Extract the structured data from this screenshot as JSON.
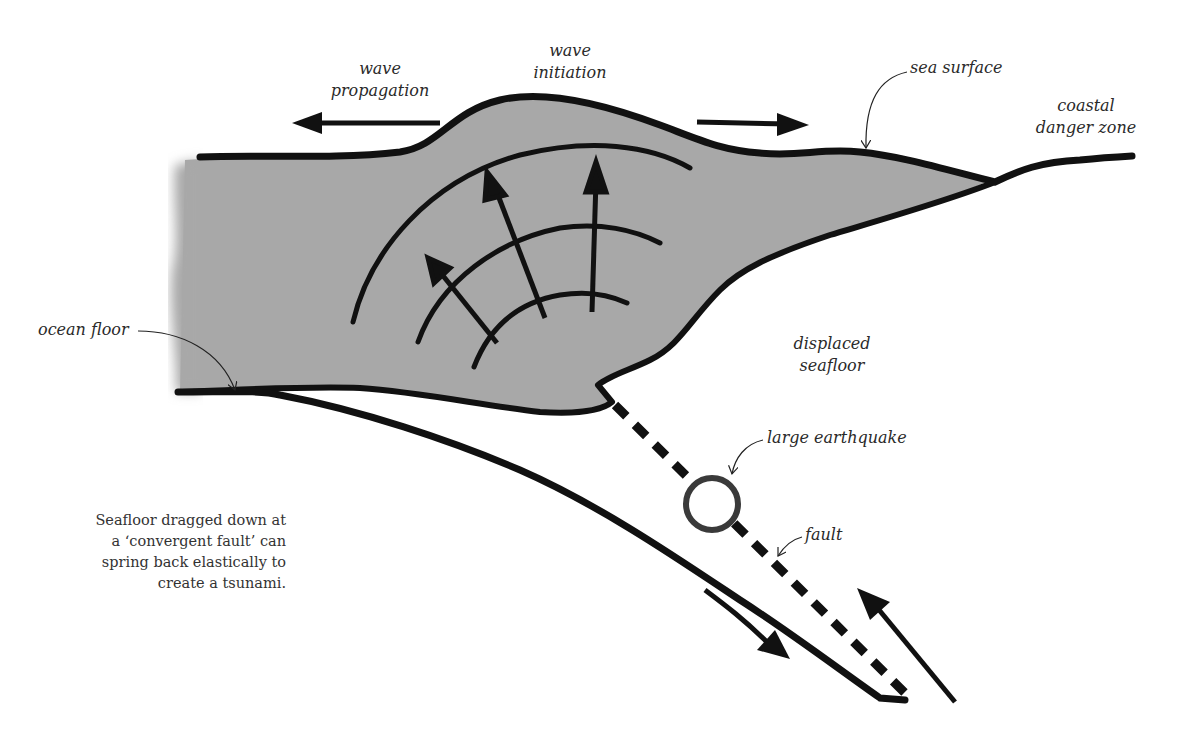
{
  "diagram": {
    "type": "tsunami-generation-cross-section",
    "colors": {
      "water": "#a8a8a8",
      "ink": "#111111",
      "earthquake_ring": "#3a3a3a",
      "background": "#ffffff"
    },
    "labels": {
      "wave_propagation": [
        "wave",
        "propagation"
      ],
      "wave_initiation": [
        "wave",
        "initiation"
      ],
      "sea_surface": "sea surface",
      "coastal_danger_zone": [
        "coastal",
        "danger zone"
      ],
      "ocean_floor": "ocean floor",
      "displaced_seafloor": [
        "displaced",
        "seafloor"
      ],
      "large_earthquake": "large earthquake",
      "fault": "fault"
    },
    "caption": [
      "Seafloor dragged down at",
      "a ‘convergent fault’ can",
      "spring back elastically to",
      "create a tsunami."
    ],
    "icons": {
      "propagation_left": "arrow-left-icon",
      "propagation_right": "arrow-right-icon",
      "uplift_arrows": "arrow-up-icon",
      "plate_down": "arrow-down-right-icon",
      "plate_up": "arrow-up-left-icon",
      "earthquake": "circle-focus-icon"
    }
  }
}
